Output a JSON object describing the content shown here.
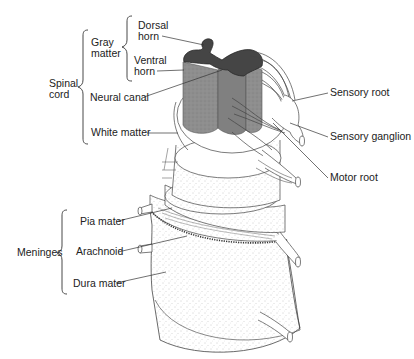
{
  "diagram": {
    "labels": {
      "dorsal_horn_line1": "Dorsal",
      "dorsal_horn_line2": "horn",
      "gray_matter_line1": "Gray",
      "gray_matter_line2": "matter",
      "ventral_horn_line1": "Ventral",
      "ventral_horn_line2": "horn",
      "spinal_cord_line1": "Spinal",
      "spinal_cord_line2": "cord",
      "neural_canal": "Neural canal",
      "white_matter": "White matter",
      "sensory_root": "Sensory root",
      "sensory_ganglion": "Sensory ganglion",
      "motor_root": "Motor root",
      "pia_mater": "Pia mater",
      "arachnoid": "Arachnoid",
      "dura_mater": "Dura mater",
      "meninges": "Meninges"
    },
    "groups": [
      {
        "name": "Spinal cord",
        "members": [
          "Gray matter",
          "Neural canal",
          "White matter"
        ]
      },
      {
        "name": "Gray matter",
        "members": [
          "Dorsal horn",
          "Ventral horn"
        ]
      },
      {
        "name": "Meninges",
        "members": [
          "Pia mater",
          "Arachnoid",
          "Dura mater"
        ]
      }
    ],
    "colors": {
      "gray_matter": "#4a4a4a",
      "white_matter_cut": "#8c8c8c",
      "line": "#333333",
      "background": "#ffffff"
    }
  }
}
